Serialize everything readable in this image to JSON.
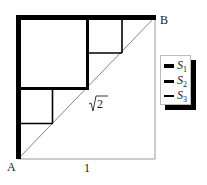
{
  "diagram": {
    "points": {
      "A": {
        "label": "A"
      },
      "B": {
        "label": "B"
      }
    },
    "side_label": "1",
    "diagonal_label": "√2",
    "diagonal_radicand": "2",
    "colors": {
      "stroke": "#000000",
      "outer_square_stroke": "#999999",
      "diagonal": "#777777"
    }
  },
  "legend": {
    "items": [
      {
        "symbol": "S",
        "sub": "1",
        "weight": "thick"
      },
      {
        "symbol": "S",
        "sub": "2",
        "weight": "medium"
      },
      {
        "symbol": "S",
        "sub": "3",
        "weight": "thin"
      }
    ]
  }
}
